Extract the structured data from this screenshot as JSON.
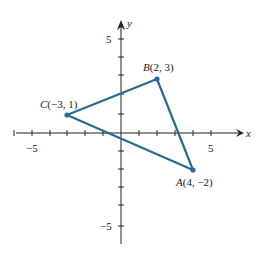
{
  "diagram": {
    "type": "coordinate-plane-triangle",
    "axes": {
      "x_label": "x",
      "y_label": "y",
      "x_range": [
        -6,
        6
      ],
      "y_range": [
        -6,
        6
      ],
      "x_tick_labels": [
        {
          "value": -5,
          "text": "−5"
        },
        {
          "value": 5,
          "text": "5"
        }
      ],
      "y_tick_labels": [
        {
          "value": 5,
          "text": "5"
        },
        {
          "value": -5,
          "text": "−5"
        }
      ]
    },
    "points": [
      {
        "name": "A",
        "x": 4,
        "y": -2,
        "coords_text": "(4, −2)"
      },
      {
        "name": "B",
        "x": 2,
        "y": 3,
        "coords_text": "(2, 3)"
      },
      {
        "name": "C",
        "x": -3,
        "y": 1,
        "coords_text": "(−3, 1)"
      }
    ],
    "edges": [
      [
        "A",
        "B"
      ],
      [
        "B",
        "C"
      ],
      [
        "C",
        "A"
      ]
    ],
    "colors": {
      "triangle": "#2b6a8e",
      "axes": "#222222"
    }
  }
}
